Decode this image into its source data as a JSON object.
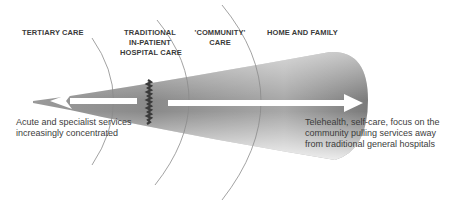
{
  "diagram": {
    "zones": [
      {
        "id": "tertiary",
        "lines": [
          "TERTIARY CARE"
        ]
      },
      {
        "id": "traditional",
        "lines": [
          "TRADITIONAL",
          "IN-PATIENT",
          "HOSPITAL CARE"
        ]
      },
      {
        "id": "community",
        "lines": [
          "'COMMUNITY'",
          "CARE"
        ]
      },
      {
        "id": "home",
        "lines": [
          "HOME AND  FAMILY"
        ]
      }
    ],
    "captions": {
      "left": [
        "Acute and specialist services",
        "increasingly concentrated"
      ],
      "right": [
        "Telehealth, self-care, focus on the",
        "community pulling services away",
        "from traditional general hospitals"
      ]
    },
    "arrows": {
      "left": {
        "direction": "left",
        "meaning": "concentration of acute and specialist services"
      },
      "right": {
        "direction": "right",
        "meaning": "services pulled toward community and home"
      }
    },
    "colors": {
      "cone_dark": "#6e6e6e",
      "cone_light": "#d8d8d8",
      "arc": "#8a8a8a",
      "arrow": "#ffffff",
      "divider": "#3a3a3a",
      "text": "#3a3a3a"
    }
  }
}
